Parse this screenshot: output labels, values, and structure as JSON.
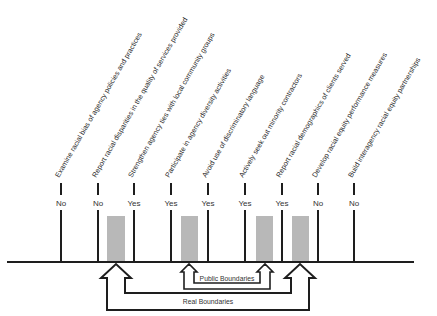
{
  "diagram": {
    "items": [
      {
        "label": "Examine racial bias of agency policies and practices",
        "answer": "No",
        "x": 61
      },
      {
        "label": "Report racial disparities in the quality of services provided",
        "answer": "No",
        "x": 98
      },
      {
        "label": "Strengthen agency ties with local community groups",
        "answer": "Yes",
        "x": 134
      },
      {
        "label": "Participate in agency diversity activities",
        "answer": "Yes",
        "x": 171
      },
      {
        "label": "Avoid use of discriminatory language",
        "answer": "Yes",
        "x": 208
      },
      {
        "label": "Actively seek out minority contractors",
        "answer": "Yes",
        "x": 245
      },
      {
        "label": "Report racial demographics of clients served",
        "answer": "Yes",
        "x": 282
      },
      {
        "label": "Develop racial equity performance measures",
        "answer": "No",
        "x": 318
      },
      {
        "label": "Build interagency racial equity partnerships",
        "answer": "No",
        "x": 354
      }
    ],
    "boundaries": {
      "public_label": "Public Boundaries",
      "real_label": "Real Boundaries"
    },
    "colors": {
      "line": "#1e1e1e",
      "shade": "#b8b8b8"
    }
  }
}
